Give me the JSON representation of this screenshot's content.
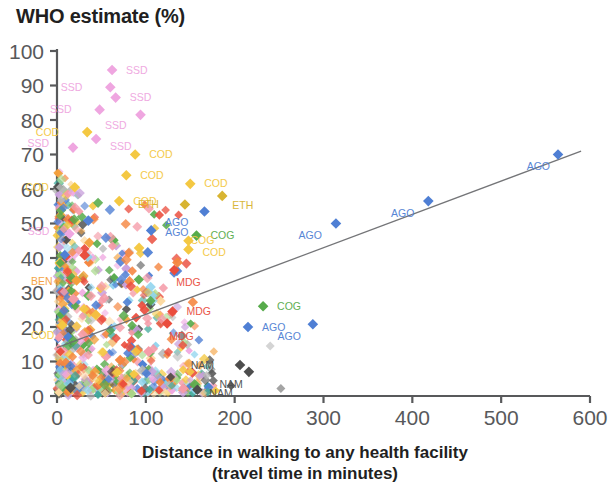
{
  "chart_data": {
    "type": "scatter",
    "title": "WHO estimate (%)",
    "ylabel": "WHO estimate (%)",
    "xlabel": "Distance in walking to any health facility",
    "xlabel_line2": "(travel time in minutes)",
    "xlim": [
      0,
      600
    ],
    "ylim": [
      0,
      100
    ],
    "xticks": [
      0,
      100,
      200,
      300,
      400,
      500,
      600
    ],
    "yticks": [
      0,
      10,
      20,
      30,
      40,
      50,
      60,
      70,
      80,
      90,
      100
    ],
    "grid": false,
    "legend": "none",
    "trendline": {
      "x0": 0,
      "y0": 14,
      "x1": 590,
      "y1": 71,
      "color": "#6d6e71"
    },
    "colors": {
      "SSD": "#efa6e0",
      "COD": "#f4c842",
      "ETH": "#d8b431",
      "AGO": "#4f7fd4",
      "COG": "#57ab4b",
      "MDG": "#ea4d3d",
      "NAM": "#4d4d4d",
      "BEN": "#f3a03c",
      "other_orange": "#f5853f",
      "other_pink": "#f59ba8",
      "other_lightblue": "#8fd4ee",
      "other_gray": "#b7b7b7",
      "other_teal": "#3fa89b",
      "other_lightgreen": "#a8d municipality"
    },
    "annotations": [
      {
        "label": "SSD",
        "x": 72,
        "y": 94,
        "color": "#efa6e0"
      },
      {
        "label": "SSD",
        "x": 48,
        "y": 90,
        "color": "#efa6e0"
      },
      {
        "label": "SSD",
        "x": 72,
        "y": 87,
        "color": "#efa6e0"
      },
      {
        "label": "SSD",
        "x": 40,
        "y": 83,
        "color": "#efa6e0"
      },
      {
        "label": "SSD",
        "x": 88,
        "y": 78,
        "color": "#efa6e0"
      },
      {
        "label": "SSD",
        "x": 54,
        "y": 73,
        "color": "#efa6e0"
      },
      {
        "label": "SSD",
        "x": 8,
        "y": 47,
        "color": "#efa6e0"
      },
      {
        "label": "COD",
        "x": 6,
        "y": 76,
        "color": "#f4c842"
      },
      {
        "label": "COD",
        "x": 100,
        "y": 70,
        "color": "#f4c842"
      },
      {
        "label": "COD",
        "x": 88,
        "y": 64,
        "color": "#f4c842"
      },
      {
        "label": "COD",
        "x": 6,
        "y": 61,
        "color": "#f4c842"
      },
      {
        "label": "COD",
        "x": 160,
        "y": 61,
        "color": "#f4c842"
      },
      {
        "label": "COD",
        "x": 88,
        "y": 57,
        "color": "#f4c842"
      },
      {
        "label": "COD",
        "x": 6,
        "y": 20,
        "color": "#f4c842"
      },
      {
        "label": "COD",
        "x": 152,
        "y": 41,
        "color": "#f4c842"
      },
      {
        "label": "ETH",
        "x": 150,
        "y": 55,
        "color": "#d8b431"
      },
      {
        "label": "ETH",
        "x": 198,
        "y": 54,
        "color": "#d8b431"
      },
      {
        "label": "AGO",
        "x": 118,
        "y": 50,
        "color": "#4f7fd4"
      },
      {
        "label": "AGO",
        "x": 170,
        "y": 53,
        "color": "#4f7fd4"
      },
      {
        "label": "AGO",
        "x": 314,
        "y": 50,
        "color": "#4f7fd4"
      },
      {
        "label": "AGO",
        "x": 418,
        "y": 56,
        "color": "#4f7fd4"
      },
      {
        "label": "AGO",
        "x": 564,
        "y": 70,
        "color": "#4f7fd4"
      },
      {
        "label": "AGO",
        "x": 215,
        "y": 20,
        "color": "#4f7fd4"
      },
      {
        "label": "AGO",
        "x": 288,
        "y": 21,
        "color": "#4f7fd4"
      },
      {
        "label": "COG",
        "x": 166,
        "y": 47,
        "color": "#57ab4b"
      },
      {
        "label": "COG",
        "x": 243,
        "y": 26,
        "color": "#57ab4b"
      },
      {
        "label": "MDG",
        "x": 142,
        "y": 37,
        "color": "#ea4d3d"
      },
      {
        "label": "MDG",
        "x": 138,
        "y": 25,
        "color": "#ea4d3d"
      },
      {
        "label": "MDG",
        "x": 130,
        "y": 21,
        "color": "#ea4d3d"
      },
      {
        "label": "BEN",
        "x": 10,
        "y": 33,
        "color": "#f3a03c"
      },
      {
        "label": "NAM",
        "x": 212,
        "y": 9,
        "color": "#4d4d4d"
      },
      {
        "label": "NAM",
        "x": 222,
        "y": 7,
        "color": "#4d4d4d"
      },
      {
        "label": "NAM",
        "x": 160,
        "y": 2,
        "color": "#4d4d4d"
      }
    ],
    "labelled_points": [
      {
        "label": "SSD",
        "x": 62,
        "y": 94.5,
        "color": "#efa6e0",
        "lx": 12,
        "ly": 0
      },
      {
        "label": "SSD",
        "x": 60,
        "y": 89.5,
        "color": "#efa6e0",
        "lx": -26,
        "ly": 0
      },
      {
        "label": "SSD",
        "x": 66,
        "y": 86.5,
        "color": "#efa6e0",
        "lx": 12,
        "ly": 0
      },
      {
        "label": "SSD",
        "x": 48,
        "y": 83.0,
        "color": "#efa6e0",
        "lx": -26,
        "ly": 0
      },
      {
        "label": "SSD",
        "x": 94,
        "y": 81.5,
        "color": "#efa6e0",
        "lx": -12,
        "ly": 11
      },
      {
        "label": "SSD",
        "x": 44,
        "y": 74.5,
        "color": "#efa6e0",
        "lx": 12,
        "ly": 7
      },
      {
        "label": "SSD",
        "x": 18,
        "y": 72.0,
        "color": "#efa6e0",
        "lx": -22,
        "ly": -4
      },
      {
        "label": "SSD",
        "x": 14,
        "y": 47.0,
        "color": "#efa6e0",
        "lx": -18,
        "ly": -2
      },
      {
        "label": "COD",
        "x": 34,
        "y": 76.5,
        "color": "#f4c842",
        "lx": -26,
        "ly": 0
      },
      {
        "label": "COD",
        "x": 88,
        "y": 70.0,
        "color": "#f4c842",
        "lx": 12,
        "ly": 0
      },
      {
        "label": "COD",
        "x": 78,
        "y": 64.0,
        "color": "#f4c842",
        "lx": 12,
        "ly": 0
      },
      {
        "label": "COD",
        "x": 20,
        "y": 60.5,
        "color": "#f4c842",
        "lx": -24,
        "ly": 0
      },
      {
        "label": "COD",
        "x": 150,
        "y": 61.5,
        "color": "#f4c842",
        "lx": 12,
        "ly": 0
      },
      {
        "label": "COD",
        "x": 70,
        "y": 56.5,
        "color": "#f4c842",
        "lx": 12,
        "ly": 0
      },
      {
        "label": "COD",
        "x": 148,
        "y": 42.5,
        "color": "#f4c842",
        "lx": 12,
        "ly": 3
      },
      {
        "label": "COD",
        "x": 6,
        "y": 20.5,
        "color": "#f4c842",
        "lx": -6,
        "ly": 10
      },
      {
        "label": "ETH",
        "x": 144,
        "y": 55.5,
        "color": "#d8b431",
        "lx": -24,
        "ly": 0
      },
      {
        "label": "ETH",
        "x": 186,
        "y": 58.0,
        "color": "#d8b431",
        "lx": 8,
        "ly": 9
      },
      {
        "label": "AGO",
        "x": 106,
        "y": 48.0,
        "color": "#4f7fd4",
        "lx": 12,
        "ly": 2
      },
      {
        "label": "AGO",
        "x": 166,
        "y": 53.5,
        "color": "#4f7fd4",
        "lx": -14,
        "ly": 11
      },
      {
        "label": "AGO",
        "x": 314,
        "y": 50.0,
        "color": "#4f7fd4",
        "lx": -12,
        "ly": 12
      },
      {
        "label": "AGO",
        "x": 418,
        "y": 56.5,
        "color": "#4f7fd4",
        "lx": -12,
        "ly": 12
      },
      {
        "label": "AGO",
        "x": 564,
        "y": 70.0,
        "color": "#4f7fd4",
        "lx": -6,
        "ly": 12
      },
      {
        "label": "AGO",
        "x": 215,
        "y": 20.0,
        "color": "#4f7fd4",
        "lx": 12,
        "ly": 0
      },
      {
        "label": "AGO",
        "x": 288,
        "y": 20.8,
        "color": "#4f7fd4",
        "lx": -10,
        "ly": 12
      },
      {
        "label": "COG",
        "x": 157,
        "y": 46.5,
        "color": "#57ab4b",
        "lx": 12,
        "ly": 0
      },
      {
        "label": "COG",
        "x": 232,
        "y": 26.0,
        "color": "#57ab4b",
        "lx": 12,
        "ly": 0
      },
      {
        "label": "COG",
        "x": 148,
        "y": 45.0,
        "color": "#f4c842",
        "lx": 0,
        "ly": 0
      },
      {
        "label": "MDG",
        "x": 132,
        "y": 36.5,
        "color": "#ea4d3d",
        "lx": 0,
        "ly": 12
      },
      {
        "label": "MDG",
        "x": 130,
        "y": 24.5,
        "color": "#ea4d3d",
        "lx": 12,
        "ly": 0
      },
      {
        "label": "MDG",
        "x": 124,
        "y": 21.0,
        "color": "#ea4d3d",
        "lx": 0,
        "ly": 13
      },
      {
        "label": "BEN",
        "x": 22,
        "y": 33.5,
        "color": "#f3a03c",
        "lx": -22,
        "ly": 1
      },
      {
        "label": "NAM",
        "x": 206,
        "y": 9.0,
        "color": "#4d4d4d",
        "lx": -24,
        "ly": 0
      },
      {
        "label": "NAM",
        "x": 216,
        "y": 7.0,
        "color": "#4d4d4d",
        "lx": -4,
        "ly": 13
      },
      {
        "label": "NAM",
        "x": 158,
        "y": 1.8,
        "color": "#4d4d4d",
        "lx": 10,
        "ly": 4
      }
    ]
  }
}
